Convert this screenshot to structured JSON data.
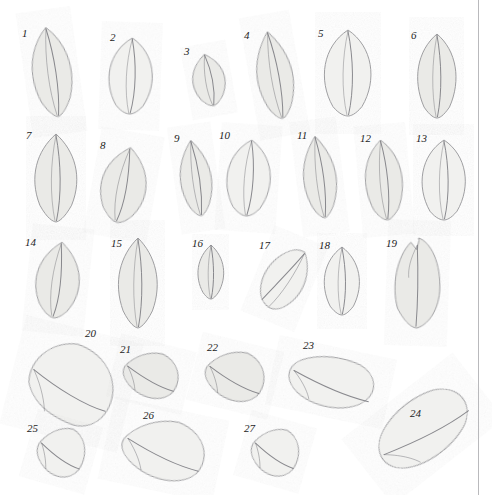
{
  "plate": {
    "title": "Leaf specimen plate",
    "background_color": "#ffffff",
    "border_rule_color": "#b9b9bc",
    "border_rule_x": 478,
    "leaf_fill_color": "#e9e9e6",
    "leaf_fill_color_light": "#f1f1ef",
    "leaf_outline_color": "#8e8e92",
    "leaf_vein_color": "#77777c",
    "label_color": "#1d1d1d",
    "width": 492,
    "height": 495
  },
  "specimens": [
    {
      "id": 1,
      "label": "1",
      "label_x": 22,
      "label_y": 28,
      "cx": 52,
      "cy": 72,
      "rx": 24,
      "ry": 45,
      "rot": -8,
      "shape": "ovate-acuminate",
      "tone": "mid"
    },
    {
      "id": 2,
      "label": "2",
      "label_x": 110,
      "label_y": 32,
      "cx": 131,
      "cy": 76,
      "rx": 26,
      "ry": 38,
      "rot": 2,
      "shape": "broad-ovate",
      "tone": "light"
    },
    {
      "id": 3,
      "label": "3",
      "label_x": 184,
      "label_y": 46,
      "cx": 209,
      "cy": 80,
      "rx": 20,
      "ry": 26,
      "rot": -10,
      "shape": "small-ovate",
      "tone": "mid"
    },
    {
      "id": 4,
      "label": "4",
      "label_x": 244,
      "label_y": 30,
      "cx": 275,
      "cy": 75,
      "rx": 23,
      "ry": 44,
      "rot": -10,
      "shape": "lanceolate",
      "tone": "mid"
    },
    {
      "id": 5,
      "label": "5",
      "label_x": 318,
      "label_y": 28,
      "cx": 348,
      "cy": 73,
      "rx": 28,
      "ry": 43,
      "rot": 0,
      "shape": "broad-ovate",
      "tone": "light"
    },
    {
      "id": 6,
      "label": "6",
      "label_x": 411,
      "label_y": 30,
      "cx": 437,
      "cy": 76,
      "rx": 24,
      "ry": 42,
      "rot": 0,
      "shape": "ovate",
      "tone": "mid"
    },
    {
      "id": 7,
      "label": "7",
      "label_x": 26,
      "label_y": 130,
      "cx": 56,
      "cy": 178,
      "rx": 26,
      "ry": 44,
      "rot": 0,
      "shape": "ovate-acuminate",
      "tone": "mid"
    },
    {
      "id": 8,
      "label": "8",
      "label_x": 100,
      "label_y": 140,
      "cx": 124,
      "cy": 185,
      "rx": 27,
      "ry": 38,
      "rot": 10,
      "shape": "obovate",
      "tone": "mid"
    },
    {
      "id": 9,
      "label": "9",
      "label_x": 174,
      "label_y": 133,
      "cx": 196,
      "cy": 178,
      "rx": 20,
      "ry": 38,
      "rot": -8,
      "shape": "lanceolate",
      "tone": "mid"
    },
    {
      "id": 10,
      "label": "10",
      "label_x": 219,
      "label_y": 130,
      "cx": 249,
      "cy": 178,
      "rx": 26,
      "ry": 38,
      "rot": 4,
      "shape": "broad-ovate",
      "tone": "light"
    },
    {
      "id": 11,
      "label": "11",
      "label_x": 297,
      "label_y": 130,
      "cx": 320,
      "cy": 177,
      "rx": 21,
      "ry": 41,
      "rot": -7,
      "shape": "lanceolate",
      "tone": "mid"
    },
    {
      "id": 12,
      "label": "12",
      "label_x": 360,
      "label_y": 133,
      "cx": 384,
      "cy": 180,
      "rx": 23,
      "ry": 40,
      "rot": -5,
      "shape": "ovate",
      "tone": "mid"
    },
    {
      "id": 13,
      "label": "13",
      "label_x": 416,
      "label_y": 133,
      "cx": 444,
      "cy": 180,
      "rx": 26,
      "ry": 40,
      "rot": 0,
      "shape": "broad-ovate",
      "tone": "light"
    },
    {
      "id": 14,
      "label": "14",
      "label_x": 25,
      "label_y": 237,
      "cx": 58,
      "cy": 280,
      "rx": 26,
      "ry": 38,
      "rot": 6,
      "shape": "obovate",
      "tone": "mid"
    },
    {
      "id": 15,
      "label": "15",
      "label_x": 111,
      "label_y": 238,
      "cx": 138,
      "cy": 283,
      "rx": 24,
      "ry": 45,
      "rot": 0,
      "shape": "ovate-acuminate",
      "tone": "mid"
    },
    {
      "id": 16,
      "label": "16",
      "label_x": 192,
      "label_y": 238,
      "cx": 211,
      "cy": 272,
      "rx": 16,
      "ry": 27,
      "rot": 0,
      "shape": "small-ovate",
      "tone": "mid"
    },
    {
      "id": 17,
      "label": "17",
      "label_x": 259,
      "label_y": 240,
      "cx": 285,
      "cy": 280,
      "rx": 24,
      "ry": 33,
      "rot": 22,
      "shape": "oblique-ovate",
      "tone": "light"
    },
    {
      "id": 18,
      "label": "18",
      "label_x": 319,
      "label_y": 240,
      "cx": 342,
      "cy": 281,
      "rx": 22,
      "ry": 34,
      "rot": 0,
      "shape": "ovate",
      "tone": "light"
    },
    {
      "id": 19,
      "label": "19",
      "label_x": 386,
      "label_y": 238,
      "cx": 417,
      "cy": 283,
      "rx": 25,
      "ry": 45,
      "rot": 2,
      "shape": "notched-ovate",
      "tone": "mid"
    },
    {
      "id": 20,
      "label": "20",
      "label_x": 85,
      "label_y": 328,
      "cx": 72,
      "cy": 384,
      "rx": 44,
      "ry": 40,
      "rot": 14,
      "shape": "large-obovate",
      "tone": "light"
    },
    {
      "id": 21,
      "label": "21",
      "label_x": 120,
      "label_y": 344,
      "cx": 152,
      "cy": 375,
      "rx": 28,
      "ry": 23,
      "rot": 14,
      "shape": "oblique-round",
      "tone": "mid"
    },
    {
      "id": 22,
      "label": "22",
      "label_x": 207,
      "label_y": 342,
      "cx": 236,
      "cy": 376,
      "rx": 30,
      "ry": 25,
      "rot": 14,
      "shape": "oblique-round",
      "tone": "mid"
    },
    {
      "id": 23,
      "label": "23",
      "label_x": 303,
      "label_y": 340,
      "cx": 333,
      "cy": 382,
      "rx": 44,
      "ry": 26,
      "rot": 12,
      "shape": "oblique-elliptic",
      "tone": "light"
    },
    {
      "id": 24,
      "label": "24",
      "label_x": 410,
      "label_y": 408,
      "cx": 424,
      "cy": 428,
      "rx": 52,
      "ry": 30,
      "rot": -38,
      "shape": "large-oblique",
      "tone": "light"
    },
    {
      "id": 25,
      "label": "25",
      "label_x": 27,
      "label_y": 423,
      "cx": 62,
      "cy": 452,
      "rx": 24,
      "ry": 25,
      "rot": 16,
      "shape": "oblique-round",
      "tone": "light"
    },
    {
      "id": 26,
      "label": "26",
      "label_x": 143,
      "label_y": 410,
      "cx": 165,
      "cy": 450,
      "rx": 42,
      "ry": 30,
      "rot": 12,
      "shape": "oblique-round",
      "tone": "light"
    },
    {
      "id": 27,
      "label": "27",
      "label_x": 244,
      "label_y": 423,
      "cx": 276,
      "cy": 452,
      "rx": 24,
      "ry": 24,
      "rot": 16,
      "shape": "oblique-round",
      "tone": "light"
    }
  ]
}
